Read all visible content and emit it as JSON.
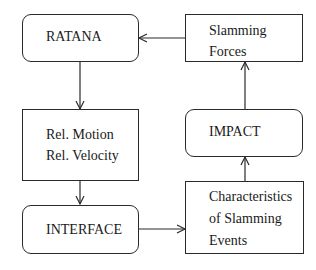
{
  "diagram": {
    "nodes": [
      {
        "id": "ratana",
        "shape": "rounded-rect",
        "lines": [
          "RATANA"
        ]
      },
      {
        "id": "slamming_forces",
        "shape": "rect",
        "lines": [
          "Slamming",
          "Forces"
        ]
      },
      {
        "id": "rel_motion",
        "shape": "rect",
        "lines": [
          "Rel. Motion",
          "Rel. Velocity"
        ]
      },
      {
        "id": "impact",
        "shape": "rounded-rect",
        "lines": [
          "IMPACT"
        ]
      },
      {
        "id": "interface",
        "shape": "rounded-rect",
        "lines": [
          "INTERFACE"
        ]
      },
      {
        "id": "characteristics",
        "shape": "rect",
        "lines": [
          "Characteristics",
          "of Slamming",
          "Events"
        ]
      }
    ],
    "edges": [
      {
        "from": "ratana",
        "to": "rel_motion"
      },
      {
        "from": "rel_motion",
        "to": "interface"
      },
      {
        "from": "interface",
        "to": "characteristics"
      },
      {
        "from": "characteristics",
        "to": "impact"
      },
      {
        "from": "impact",
        "to": "slamming_forces"
      },
      {
        "from": "slamming_forces",
        "to": "ratana"
      }
    ],
    "colors": {
      "stroke": "#2a2a2a",
      "text": "#1a1a1a",
      "background": "#ffffff"
    }
  }
}
